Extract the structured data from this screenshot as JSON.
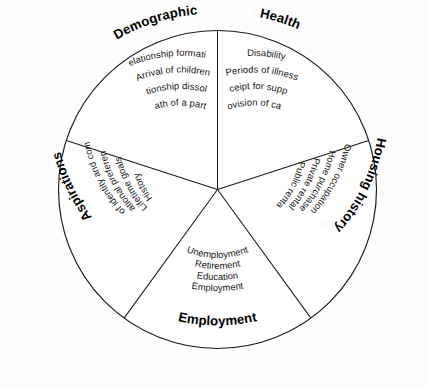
{
  "figure": {
    "name": "life-course-domains-wheel",
    "shape": "circle-five-sectors",
    "background_color": "#fdfdfd",
    "line_color": "#1a1a1a",
    "text_color": "#151515"
  },
  "sectors": [
    {
      "id": "demographic",
      "category": "Demographic",
      "items": [
        "Relationship formation",
        "Arrival of children",
        "Relationship dissolution",
        "Death of a partner"
      ]
    },
    {
      "id": "health",
      "category": "Health",
      "items": [
        "Disability",
        "Periods of illness",
        "Receipt for support",
        "Provision of care"
      ]
    },
    {
      "id": "housing-history",
      "category": "Housing history",
      "items": [
        "Public rental",
        "Private rental",
        "Home purchase",
        "Owner occupation"
      ]
    },
    {
      "id": "employment",
      "category": "Employment",
      "items": [
        "Unemployment",
        "Retirement",
        "Education",
        "Employment"
      ]
    },
    {
      "id": "aspirations",
      "category": "Aspirations",
      "items": [
        "Sense of identity and community",
        "Locational preferences",
        "Lifetime goals",
        "History"
      ]
    }
  ]
}
